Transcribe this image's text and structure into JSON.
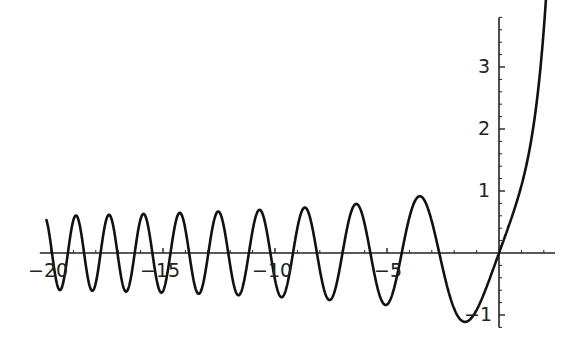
{
  "chart_data": {
    "type": "line",
    "title": "",
    "xlabel": "",
    "ylabel": "",
    "xlim": [
      -20.5,
      2.3
    ],
    "ylim": [
      -1.15,
      3.7
    ],
    "grid": false,
    "legend": null,
    "x_ticks": [
      -20,
      -15,
      -10,
      -5
    ],
    "x_tick_labels": [
      "-20",
      "-15",
      "-10",
      "-5"
    ],
    "y_ticks": [
      -1,
      1,
      2,
      3
    ],
    "y_tick_labels": [
      "-1",
      "1",
      "2",
      "3"
    ],
    "series": [
      {
        "name": "y(x)",
        "color": "#111111",
        "x": [
          -20,
          -19,
          -18,
          -17,
          -16,
          -15,
          -14,
          -13,
          -12,
          -11,
          -10,
          -9,
          -8,
          -7,
          -6,
          -5,
          -4,
          -3,
          -2,
          -1.3,
          -1,
          0,
          0.5,
          1,
          1.5,
          2,
          2.3
        ],
        "values": [
          -0.45,
          0.55,
          -0.3,
          0.2,
          -0.6,
          0.45,
          0.1,
          -0.55,
          0.6,
          -0.2,
          -0.35,
          0.7,
          -0.5,
          -0.2,
          0.78,
          -0.7,
          0.1,
          0.92,
          -0.4,
          -1.1,
          -1.0,
          0.0,
          0.52,
          1.14,
          2.0,
          3.1,
          3.6
        ]
      }
    ]
  },
  "axes": {
    "x_labels": [
      "-20",
      "-15",
      "-10",
      "-5"
    ],
    "y_labels": [
      "3",
      "2",
      "1",
      "-1"
    ]
  },
  "colors": {
    "curve": "#111111",
    "axes": "#222222",
    "background": "#ffffff"
  },
  "layout": {
    "origin_px": [
      499,
      253
    ],
    "px_per_x": 22.4,
    "px_per_y": 62,
    "x_axis_from": -20.5,
    "x_axis_to": 2.5,
    "y_axis_from": -1.2,
    "y_axis_to": 3.8,
    "x_minor_step": 1,
    "y_minor_step": 0.2,
    "curve_x_min": -20.2,
    "curve_x_max": 2.3,
    "ode_initial": {
      "y0": 0,
      "dy0": 1
    }
  }
}
